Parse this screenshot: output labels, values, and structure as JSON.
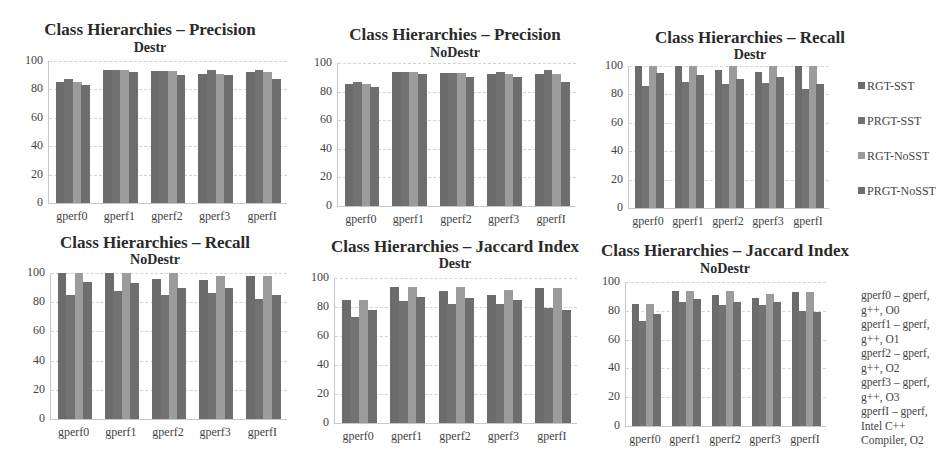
{
  "colors": {
    "RGT-SST": "#6c6c6c",
    "PRGT-SST": "#727272",
    "RGT-NoSST": "#9c9c9c",
    "PRGT-NoSST": "#6e6e6e"
  },
  "legend": {
    "series": [
      "RGT-SST",
      "PRGT-SST",
      "RGT-NoSST",
      "PRGT-NoSST"
    ]
  },
  "category_legend": [
    "gperf0 – gperf,",
    "g++, O0",
    "gperf1 – gperf,",
    "g++, O1",
    "gperf2 – gperf,",
    "g++, O2",
    "gperf3 – gperf,",
    "g++, O3",
    "gperfI – gperf,",
    "Intel C++",
    "Compiler, O2"
  ],
  "chart_data": [
    {
      "type": "bar",
      "title": "Class Hierarchies – Precision",
      "subtitle": "Destr",
      "categories": [
        "gperf0",
        "gperf1",
        "gperf2",
        "gperf3",
        "gperfI"
      ],
      "yticks": [
        "0",
        "20",
        "40",
        "60",
        "80",
        "100"
      ],
      "ylim": [
        0,
        100
      ],
      "series": [
        {
          "name": "RGT-SST",
          "values": [
            85,
            94,
            93,
            91,
            92
          ]
        },
        {
          "name": "PRGT-SST",
          "values": [
            87,
            94,
            93,
            94,
            94
          ]
        },
        {
          "name": "RGT-NoSST",
          "values": [
            85,
            94,
            93,
            91,
            92
          ]
        },
        {
          "name": "PRGT-NoSST",
          "values": [
            83,
            92,
            90,
            90,
            87
          ]
        }
      ]
    },
    {
      "type": "bar",
      "title": "Class Hierarchies – Precision",
      "subtitle": "NoDestr",
      "categories": [
        "gperf0",
        "gperf1",
        "gperf2",
        "gperf3",
        "gperfI"
      ],
      "yticks": [
        "0",
        "20",
        "40",
        "60",
        "80",
        "100"
      ],
      "ylim": [
        0,
        100
      ],
      "series": [
        {
          "name": "RGT-SST",
          "values": [
            85,
            94,
            93,
            92,
            92
          ]
        },
        {
          "name": "PRGT-SST",
          "values": [
            87,
            94,
            93,
            94,
            95
          ]
        },
        {
          "name": "RGT-NoSST",
          "values": [
            85,
            94,
            93,
            92,
            92
          ]
        },
        {
          "name": "PRGT-NoSST",
          "values": [
            83,
            92,
            90,
            90,
            87
          ]
        }
      ]
    },
    {
      "type": "bar",
      "title": "Class Hierarchies – Recall",
      "subtitle": "Destr",
      "categories": [
        "gperf0",
        "gperf1",
        "gperf2",
        "gperf3",
        "gperfI"
      ],
      "yticks": [
        "0",
        "20",
        "40",
        "60",
        "80",
        "100"
      ],
      "ylim": [
        0,
        100
      ],
      "series": [
        {
          "name": "RGT-SST",
          "values": [
            100,
            100,
            97,
            96,
            100
          ]
        },
        {
          "name": "PRGT-SST",
          "values": [
            86,
            89,
            87,
            88,
            84
          ]
        },
        {
          "name": "RGT-NoSST",
          "values": [
            100,
            100,
            100,
            100,
            100
          ]
        },
        {
          "name": "PRGT-NoSST",
          "values": [
            95,
            94,
            91,
            92,
            87
          ]
        }
      ],
      "legend_position": "right"
    },
    {
      "type": "bar",
      "title": "Class Hierarchies – Recall",
      "subtitle": "NoDestr",
      "categories": [
        "gperf0",
        "gperf1",
        "gperf2",
        "gperf3",
        "gperfI"
      ],
      "yticks": [
        "0",
        "20",
        "40",
        "60",
        "80",
        "100"
      ],
      "ylim": [
        0,
        100
      ],
      "series": [
        {
          "name": "RGT-SST",
          "values": [
            100,
            100,
            96,
            95,
            98
          ]
        },
        {
          "name": "PRGT-SST",
          "values": [
            85,
            88,
            85,
            86,
            82
          ]
        },
        {
          "name": "RGT-NoSST",
          "values": [
            100,
            100,
            100,
            98,
            98
          ]
        },
        {
          "name": "PRGT-NoSST",
          "values": [
            94,
            93,
            90,
            90,
            85
          ]
        }
      ]
    },
    {
      "type": "bar",
      "title": "Class Hierarchies – Jaccard Index",
      "subtitle": "Destr",
      "categories": [
        "gperf0",
        "gperf1",
        "gperf2",
        "gperf3",
        "gperfI"
      ],
      "yticks": [
        "0",
        "20",
        "40",
        "60",
        "80",
        "100"
      ],
      "ylim": [
        0,
        100
      ],
      "series": [
        {
          "name": "RGT-SST",
          "values": [
            85,
            94,
            91,
            88,
            93
          ]
        },
        {
          "name": "PRGT-SST",
          "values": [
            73,
            84,
            82,
            82,
            79
          ]
        },
        {
          "name": "RGT-NoSST",
          "values": [
            85,
            94,
            94,
            92,
            93
          ]
        },
        {
          "name": "PRGT-NoSST",
          "values": [
            78,
            87,
            86,
            85,
            78
          ]
        }
      ]
    },
    {
      "type": "bar",
      "title": "Class Hierarchies – Jaccard Index",
      "subtitle": "NoDestr",
      "categories": [
        "gperf0",
        "gperf1",
        "gperf2",
        "gperf3",
        "gperfI"
      ],
      "yticks": [
        "0",
        "20",
        "40",
        "60",
        "80",
        "100"
      ],
      "ylim": [
        0,
        100
      ],
      "series": [
        {
          "name": "RGT-SST",
          "values": [
            85,
            94,
            91,
            89,
            93
          ]
        },
        {
          "name": "PRGT-SST",
          "values": [
            73,
            86,
            84,
            84,
            80
          ]
        },
        {
          "name": "RGT-NoSST",
          "values": [
            85,
            94,
            94,
            92,
            93
          ]
        },
        {
          "name": "PRGT-NoSST",
          "values": [
            78,
            88,
            86,
            86,
            79
          ]
        }
      ],
      "legend_position": "right"
    }
  ]
}
